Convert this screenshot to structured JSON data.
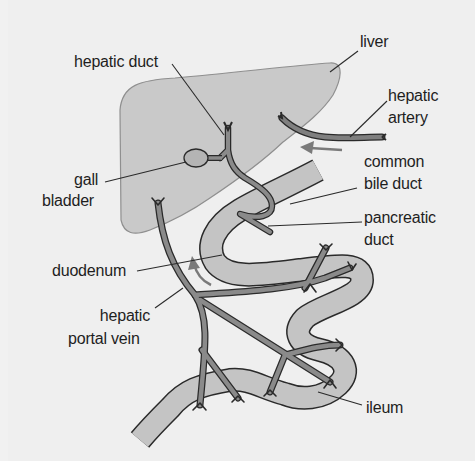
{
  "diagram": {
    "type": "anatomical",
    "colors": {
      "background": "#efefef",
      "liver_fill": "#c9c9c9",
      "intestine_fill": "#c4c4c4",
      "vessel_fill": "#8a8a8a",
      "outline": "#2a2a2a",
      "arrow": "#7a7a7a",
      "text": "#1e1e1e"
    },
    "labels": {
      "liver": "liver",
      "hepatic_duct": "hepatic duct",
      "hepatic_artery_1": "hepatic",
      "hepatic_artery_2": "artery",
      "gall_bladder_1": "gall",
      "gall_bladder_2": "bladder",
      "common_bile_duct_1": "common",
      "common_bile_duct_2": "bile duct",
      "pancreatic_duct_1": "pancreatic",
      "pancreatic_duct_2": "duct",
      "duodenum": "duodenum",
      "hepatic_portal_vein_1": "hepatic",
      "hepatic_portal_vein_2": "portal vein",
      "ileum": "ileum"
    },
    "arrows": [
      {
        "name": "hepatic-artery-flow",
        "direction": "left"
      },
      {
        "name": "portal-vein-flow",
        "direction": "up"
      }
    ]
  }
}
